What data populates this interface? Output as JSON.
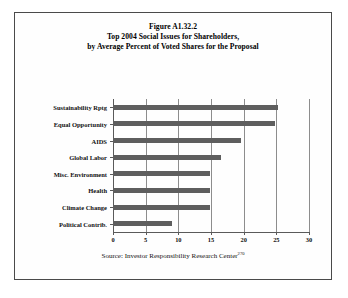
{
  "figure": {
    "title_line1": "Figure A1.32.2",
    "title_line2": "Top 2004 Social Issues for Shareholders,",
    "title_line3": "by Average Percent of Voted Shares for the Proposal",
    "source_prefix": "Source: Investor Responsibility Research Center",
    "source_footnote": "270"
  },
  "chart_data": {
    "type": "bar",
    "orientation": "horizontal",
    "xlabel": "",
    "ylabel": "",
    "xlim": [
      0,
      30
    ],
    "ylim": [
      0,
      8
    ],
    "grid": true,
    "legend": "none",
    "bar_color": "#5e5e5e",
    "categories": [
      "Sustainability Rptg",
      "Equal Opportunity",
      "AIDS",
      "Global Labor",
      "Misc. Environment",
      "Health",
      "Climate Change",
      "Political Contrib."
    ],
    "values": [
      25.2,
      24.8,
      19.6,
      16.5,
      14.8,
      14.8,
      14.8,
      9.0
    ],
    "xticks": [
      0,
      5,
      10,
      15,
      20,
      25,
      30
    ],
    "xtick_labels": [
      "0",
      "5",
      "10",
      "15",
      "20",
      "25",
      "30"
    ]
  }
}
